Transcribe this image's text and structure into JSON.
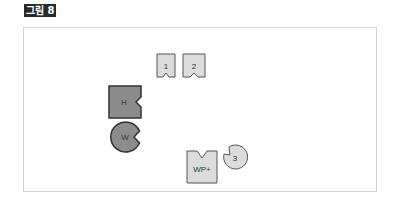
{
  "figure": {
    "label": "그림 8"
  },
  "pieces": {
    "piece1": {
      "text": "1",
      "fill": "#dcdcdc"
    },
    "piece2": {
      "text": "2",
      "fill": "#dcdcdc"
    },
    "h": {
      "text": "H",
      "fill": "#8c8c8c"
    },
    "w": {
      "text": "W",
      "fill": "#8c8c8c"
    },
    "wp": {
      "text": "WP+",
      "fill": "#dcdcdc"
    },
    "piece3": {
      "text": "3",
      "fill": "#dcdcdc"
    }
  },
  "colors": {
    "stroke": "#555555",
    "frame_border": "#d4d4d4",
    "label_bg": "#2a2a2a"
  }
}
